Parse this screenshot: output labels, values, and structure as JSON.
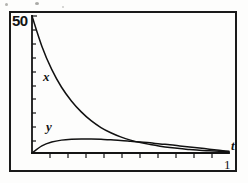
{
  "figure": {
    "name": "decay-curves-plot",
    "frame": {
      "visible": true,
      "color": "#1a1a1a"
    },
    "axes": {
      "y_axis": {
        "max_label": "50",
        "min_label": "",
        "tick_count": 10,
        "label": ""
      },
      "x_axis": {
        "label": "t",
        "tick_count": 11,
        "corner_label": "1"
      }
    },
    "curve_labels": {
      "x_curve": "x",
      "y_curve": "y"
    }
  },
  "chart_data": {
    "type": "line",
    "title": "",
    "subtitle": "",
    "xlabel": "t",
    "ylabel": "",
    "xlim": [
      0,
      1
    ],
    "ylim": [
      0,
      50
    ],
    "grid": false,
    "legend": "inline-annotations",
    "annotations": [
      {
        "text": "x",
        "x": 0.07,
        "y": 23
      },
      {
        "text": "y",
        "x": 0.09,
        "y": 7
      },
      {
        "text": "50",
        "x": 0.0,
        "y": 50
      },
      {
        "text": "t",
        "x": 1.0,
        "y": 0
      },
      {
        "text": "1",
        "x": 1.0,
        "y": -4
      }
    ],
    "x": [
      0.0,
      0.05,
      0.1,
      0.15,
      0.2,
      0.25,
      0.3,
      0.35,
      0.4,
      0.45,
      0.5,
      0.55,
      0.6,
      0.65,
      0.7,
      0.75,
      0.8,
      0.85,
      0.9,
      0.95,
      1.0
    ],
    "series": [
      {
        "name": "x",
        "values": [
          50.0,
          39.0,
          30.5,
          24.0,
          19.0,
          15.0,
          11.8,
          9.3,
          7.4,
          5.9,
          4.7,
          3.8,
          3.1,
          2.5,
          2.0,
          1.6,
          1.3,
          1.0,
          0.8,
          0.6,
          0.4
        ]
      },
      {
        "name": "y",
        "values": [
          0.0,
          2.6,
          4.0,
          4.7,
          5.0,
          5.1,
          5.1,
          5.0,
          4.8,
          4.6,
          4.3,
          4.0,
          3.7,
          3.3,
          3.0,
          2.6,
          2.2,
          1.8,
          1.4,
          1.0,
          0.6
        ]
      }
    ]
  }
}
